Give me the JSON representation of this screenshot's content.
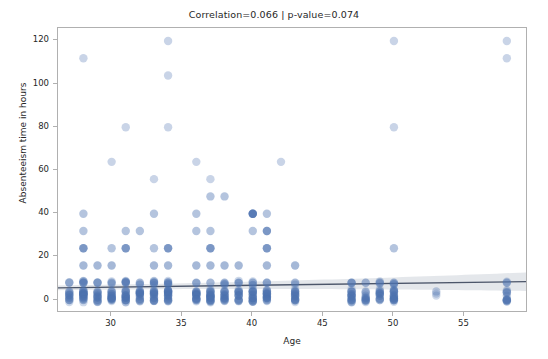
{
  "chart_data": {
    "type": "scatter",
    "title": "Correlation=0.066 | p-value=0.074",
    "xlabel": "Age",
    "ylabel": "Absenteeism time in hours",
    "xlim": [
      26.2,
      59.5
    ],
    "ylim": [
      -6,
      126
    ],
    "grid": false,
    "legend": null,
    "marker": {
      "shape": "circle",
      "color": "#4c72b0",
      "alpha": 0.35,
      "size": 4.2
    },
    "regression": {
      "type": "linear-fit-with-ci",
      "line_color": "#4c566a",
      "ci_color": "#c9cfd8",
      "slope": 0.0855,
      "intercept": 3.42,
      "y_at_xmin": 5.66,
      "y_at_xmax": 8.51,
      "ci_half_width_at_xmin": 1.1,
      "ci_half_width_at_xmax": 4.3
    },
    "xticks": [
      30,
      35,
      40,
      45,
      50,
      55
    ],
    "yticks": [
      0,
      20,
      40,
      60,
      80,
      100,
      120
    ],
    "n_points": 740,
    "points": [
      [
        28,
        112
      ],
      [
        34,
        120
      ],
      [
        34,
        104
      ],
      [
        50,
        120
      ],
      [
        58,
        120
      ],
      [
        58,
        112
      ],
      [
        31,
        80
      ],
      [
        34,
        80
      ],
      [
        50,
        80
      ],
      [
        30,
        64
      ],
      [
        36,
        64
      ],
      [
        42,
        64
      ],
      [
        33,
        56
      ],
      [
        37,
        56
      ],
      [
        37,
        48
      ],
      [
        38,
        48
      ],
      [
        36,
        40
      ],
      [
        40,
        40
      ],
      [
        41,
        40
      ],
      [
        28,
        40
      ],
      [
        33,
        40
      ],
      [
        28,
        32
      ],
      [
        31,
        32
      ],
      [
        32,
        32
      ],
      [
        36,
        32
      ],
      [
        37,
        32
      ],
      [
        40,
        32
      ],
      [
        41,
        32
      ],
      [
        28,
        24
      ],
      [
        30,
        24
      ],
      [
        31,
        24
      ],
      [
        33,
        24
      ],
      [
        34,
        24
      ],
      [
        37,
        24
      ],
      [
        41,
        24
      ],
      [
        50,
        24
      ],
      [
        28,
        16
      ],
      [
        29,
        16
      ],
      [
        30,
        16
      ],
      [
        33,
        16
      ],
      [
        34,
        16
      ],
      [
        36,
        16
      ],
      [
        37,
        16
      ],
      [
        38,
        16
      ],
      [
        39,
        16
      ],
      [
        41,
        16
      ],
      [
        43,
        16
      ],
      [
        27,
        8
      ],
      [
        28,
        8
      ],
      [
        29,
        8
      ],
      [
        30,
        8
      ],
      [
        31,
        8
      ],
      [
        32,
        8
      ],
      [
        33,
        8
      ],
      [
        34,
        8
      ],
      [
        36,
        8
      ],
      [
        37,
        8
      ],
      [
        38,
        8
      ],
      [
        39,
        8
      ],
      [
        40,
        8
      ],
      [
        41,
        8
      ],
      [
        43,
        8
      ],
      [
        47,
        8
      ],
      [
        48,
        8
      ],
      [
        49,
        8
      ],
      [
        50,
        8
      ],
      [
        58,
        8
      ],
      [
        27,
        4
      ],
      [
        28,
        4
      ],
      [
        29,
        4
      ],
      [
        30,
        4
      ],
      [
        31,
        4
      ],
      [
        32,
        4
      ],
      [
        33,
        4
      ],
      [
        34,
        4
      ],
      [
        36,
        4
      ],
      [
        37,
        4
      ],
      [
        38,
        4
      ],
      [
        39,
        4
      ],
      [
        40,
        4
      ],
      [
        41,
        4
      ],
      [
        43,
        4
      ],
      [
        47,
        4
      ],
      [
        48,
        4
      ],
      [
        49,
        4
      ],
      [
        50,
        4
      ],
      [
        53,
        4
      ],
      [
        58,
        4
      ],
      [
        27,
        2
      ],
      [
        28,
        2
      ],
      [
        29,
        2
      ],
      [
        30,
        2
      ],
      [
        31,
        2
      ],
      [
        32,
        2
      ],
      [
        33,
        2
      ],
      [
        34,
        2
      ],
      [
        36,
        2
      ],
      [
        37,
        2
      ],
      [
        38,
        2
      ],
      [
        39,
        2
      ],
      [
        40,
        2
      ],
      [
        41,
        2
      ],
      [
        43,
        2
      ],
      [
        47,
        2
      ],
      [
        48,
        2
      ],
      [
        49,
        2
      ],
      [
        50,
        2
      ],
      [
        58,
        2
      ],
      [
        27,
        0
      ],
      [
        28,
        0
      ],
      [
        29,
        0
      ],
      [
        30,
        0
      ],
      [
        31,
        0
      ],
      [
        32,
        0
      ],
      [
        33,
        0
      ],
      [
        34,
        0
      ],
      [
        36,
        0
      ],
      [
        37,
        0
      ],
      [
        38,
        0
      ],
      [
        39,
        0
      ],
      [
        40,
        0
      ],
      [
        41,
        0
      ],
      [
        43,
        0
      ],
      [
        47,
        0
      ],
      [
        48,
        0
      ],
      [
        49,
        0
      ],
      [
        50,
        0
      ],
      [
        58,
        0
      ]
    ],
    "dense_columns": [
      {
        "age": 27,
        "counts": [
          0,
          2,
          4,
          8
        ],
        "weight": 6
      },
      {
        "age": 28,
        "counts": [
          0,
          2,
          4,
          8
        ],
        "weight": 14
      },
      {
        "age": 29,
        "counts": [
          0,
          2,
          4,
          8
        ],
        "weight": 8
      },
      {
        "age": 30,
        "counts": [
          0,
          2,
          4,
          8
        ],
        "weight": 10
      },
      {
        "age": 31,
        "counts": [
          0,
          2,
          4,
          8
        ],
        "weight": 12
      },
      {
        "age": 32,
        "counts": [
          0,
          2,
          4,
          8
        ],
        "weight": 9
      },
      {
        "age": 33,
        "counts": [
          0,
          2,
          4,
          8
        ],
        "weight": 11
      },
      {
        "age": 34,
        "counts": [
          0,
          2,
          4,
          8
        ],
        "weight": 13
      },
      {
        "age": 36,
        "counts": [
          0,
          2,
          4,
          8
        ],
        "weight": 10
      },
      {
        "age": 37,
        "counts": [
          0,
          2,
          4,
          8
        ],
        "weight": 12
      },
      {
        "age": 38,
        "counts": [
          0,
          2,
          4,
          8
        ],
        "weight": 9
      },
      {
        "age": 39,
        "counts": [
          0,
          2,
          4,
          8
        ],
        "weight": 8
      },
      {
        "age": 40,
        "counts": [
          0,
          2,
          4,
          8
        ],
        "weight": 11
      },
      {
        "age": 41,
        "counts": [
          0,
          2,
          4,
          8
        ],
        "weight": 10
      },
      {
        "age": 43,
        "counts": [
          0,
          2,
          4,
          8
        ],
        "weight": 9
      },
      {
        "age": 47,
        "counts": [
          0,
          2,
          4,
          8
        ],
        "weight": 10
      },
      {
        "age": 48,
        "counts": [
          0,
          2,
          4
        ],
        "weight": 5
      },
      {
        "age": 49,
        "counts": [
          0,
          2,
          4,
          8
        ],
        "weight": 7
      },
      {
        "age": 50,
        "counts": [
          0,
          2,
          4,
          8
        ],
        "weight": 11
      },
      {
        "age": 53,
        "counts": [
          4
        ],
        "weight": 1
      },
      {
        "age": 58,
        "counts": [
          0,
          2,
          4,
          8
        ],
        "weight": 6
      }
    ]
  }
}
